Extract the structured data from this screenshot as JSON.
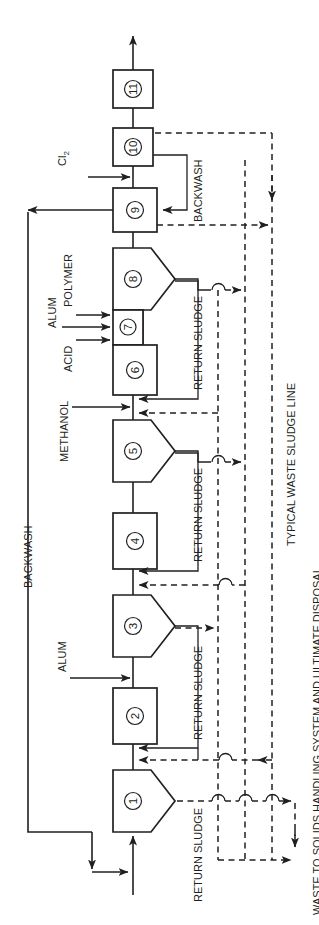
{
  "figure": {
    "orientation": "rotated-90-ccw",
    "ink_color": "#231f20",
    "background_color": "#ffffff"
  },
  "units": [
    {
      "id": "unit-1",
      "number": "1",
      "shape": "pentagon",
      "x": 113,
      "y": 770,
      "w": 56,
      "h": 62
    },
    {
      "id": "unit-2",
      "number": "2",
      "shape": "rect",
      "x": 113,
      "y": 688,
      "w": 44,
      "h": 56
    },
    {
      "id": "unit-3",
      "number": "3",
      "shape": "pentagon",
      "x": 113,
      "y": 595,
      "w": 56,
      "h": 62
    },
    {
      "id": "unit-4",
      "number": "4",
      "shape": "rect",
      "x": 113,
      "y": 513,
      "w": 44,
      "h": 56
    },
    {
      "id": "unit-5",
      "number": "5",
      "shape": "pentagon",
      "x": 113,
      "y": 420,
      "w": 56,
      "h": 62
    },
    {
      "id": "unit-6",
      "number": "6",
      "shape": "rect",
      "x": 113,
      "y": 345,
      "w": 44,
      "h": 50
    },
    {
      "id": "unit-7",
      "number": "7",
      "shape": "rect",
      "x": 113,
      "y": 310,
      "w": 30,
      "h": 35
    },
    {
      "id": "unit-8",
      "number": "8",
      "shape": "pentagon",
      "x": 113,
      "y": 248,
      "w": 56,
      "h": 62
    },
    {
      "id": "unit-9",
      "number": "9",
      "shape": "rect",
      "x": 113,
      "y": 188,
      "w": 44,
      "h": 44
    },
    {
      "id": "unit-10",
      "number": "10",
      "shape": "rect",
      "x": 113,
      "y": 128,
      "w": 40,
      "h": 38
    },
    {
      "id": "unit-11",
      "number": "11",
      "shape": "rect",
      "x": 113,
      "y": 70,
      "w": 40,
      "h": 38
    }
  ],
  "chemical_feeds": [
    {
      "name": "chlorine-feed",
      "label": "Cl",
      "subscript": "2",
      "target": "unit-9"
    },
    {
      "name": "polymer-feed",
      "label": "POLYMER",
      "target": "unit-7"
    },
    {
      "name": "alum-feed-top",
      "label": "ALUM",
      "target": "unit-7"
    },
    {
      "name": "acid-feed",
      "label": "ACID",
      "target": "unit-7"
    },
    {
      "name": "methanol-feed",
      "label": "METHANOL",
      "target": "unit-5-inlet"
    },
    {
      "name": "alum-feed-low",
      "label": "ALUM",
      "target": "unit-3-inlet"
    }
  ],
  "flow_labels": {
    "backwash_main": "BACKWASH",
    "backwash_filter": "BACKWASH",
    "return_sludge": "RETURN SLUDGE",
    "return_sludge_count": 4,
    "typical_waste_sludge_line": "TYPICAL WASTE SLUDGE LINE",
    "waste_to_solids": "WASTE TO SOLIDS HANDLING SYSTEM AND ULTIMATE DISPOSAL"
  },
  "return_sludge_labels": [
    "RETURN SLUDGE",
    "RETURN SLUDGE",
    "RETURN SLUDGE",
    "RETURN SLUDGE"
  ],
  "streams": {
    "raw_water_inlet": {
      "name": "raw-water-inlet",
      "description": "influent entering unit 1 from bottom"
    },
    "treated_outlet": {
      "name": "treated-water-outlet",
      "description": "effluent leaving unit 11 at top"
    }
  }
}
